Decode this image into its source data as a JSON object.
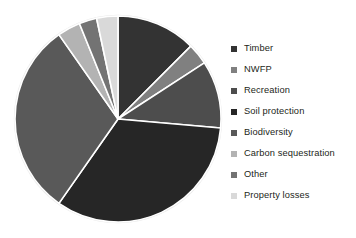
{
  "chart_data": {
    "type": "pie",
    "title": "",
    "subtitle": "",
    "xlabel": "",
    "ylabel": "",
    "grid": false,
    "legend_position": "right",
    "start_angle_deg": 0,
    "direction": "clockwise",
    "center": {
      "x": 118,
      "y": 119
    },
    "radius": 103,
    "categories": [
      "Timber",
      "NWFP",
      "Recreation",
      "Soil protection",
      "Biodiversity",
      "Carbon sequestration",
      "Other",
      "Property losses"
    ],
    "values": [
      12.5,
      3.3,
      10.6,
      33.3,
      30.6,
      3.6,
      2.8,
      3.3
    ],
    "units": "percent",
    "colors": [
      "#333333",
      "#808080",
      "#4d4d4d",
      "#262626",
      "#595959",
      "#b3b3b3",
      "#737373",
      "#d9d9d9"
    ],
    "slice_angles_deg": [
      {
        "name": "Timber",
        "start": 0,
        "end": 45
      },
      {
        "name": "NWFP",
        "start": 45,
        "end": 57
      },
      {
        "name": "Recreation",
        "start": 57,
        "end": 95
      },
      {
        "name": "Soil protection",
        "start": 95,
        "end": 215
      },
      {
        "name": "Biodiversity",
        "start": 215,
        "end": 325
      },
      {
        "name": "Carbon sequestration",
        "start": 325,
        "end": 338
      },
      {
        "name": "Other",
        "start": 338,
        "end": 348
      },
      {
        "name": "Property losses",
        "start": 348,
        "end": 360
      }
    ],
    "separator_color": "#ffffff",
    "separator_width": 1.6,
    "background": "#ffffff"
  },
  "legend": {
    "items": [
      {
        "label": "Timber",
        "color": "#333333"
      },
      {
        "label": "NWFP",
        "color": "#808080"
      },
      {
        "label": "Recreation",
        "color": "#4d4d4d"
      },
      {
        "label": "Soil protection",
        "color": "#262626"
      },
      {
        "label": "Biodiversity",
        "color": "#595959"
      },
      {
        "label": "Carbon sequestration",
        "color": "#b3b3b3"
      },
      {
        "label": "Other",
        "color": "#737373"
      },
      {
        "label": "Property losses",
        "color": "#d9d9d9"
      }
    ]
  }
}
